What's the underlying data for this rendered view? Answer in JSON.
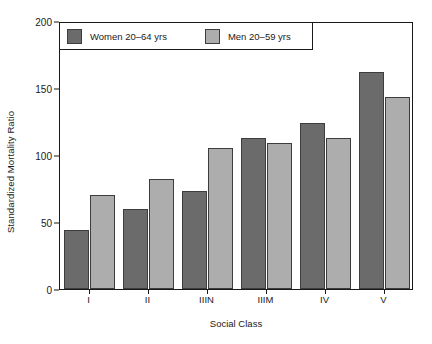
{
  "chart_data": {
    "type": "bar",
    "title": "",
    "xlabel": "Social Class",
    "ylabel": "Standardized Mortality Ratio",
    "categories": [
      "I",
      "II",
      "IIIN",
      "IIIM",
      "IV",
      "V"
    ],
    "series": [
      {
        "name": "Women 20–64 yrs",
        "color": "#6b6b6b",
        "values": [
          44,
          60,
          73,
          113,
          124,
          162
        ]
      },
      {
        "name": "Men 20–59 yrs",
        "color": "#adadad",
        "values": [
          70,
          82,
          105,
          109,
          113,
          143
        ]
      }
    ],
    "ylim": [
      0,
      200
    ],
    "yticks": [
      0,
      50,
      100,
      150,
      200
    ],
    "ytick_labels": [
      "0",
      "50",
      "100",
      "150",
      "200"
    ],
    "grid": false,
    "legend_position": "top-left",
    "bar_border_color": "#3d3d3d",
    "axis_color": "#1a1a1a",
    "background": "#ffffff"
  }
}
